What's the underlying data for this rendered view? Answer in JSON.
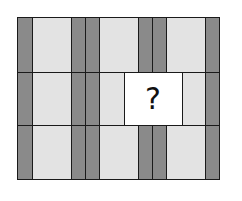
{
  "puzzle": {
    "question_mark": "?",
    "colors": {
      "dark": "#8a8a8a",
      "light": "#e3e3e3",
      "blank": "#ffffff",
      "border": "#1a1a1a"
    },
    "columns": [
      {
        "type": "dark",
        "x": 0,
        "w": 15
      },
      {
        "type": "light",
        "x": 15,
        "w": 39
      },
      {
        "type": "dark",
        "x": 54,
        "w": 14
      },
      {
        "type": "dark",
        "x": 68,
        "w": 14
      },
      {
        "type": "light",
        "x": 82,
        "w": 39
      },
      {
        "type": "dark",
        "x": 121,
        "w": 14
      },
      {
        "type": "dark",
        "x": 135,
        "w": 14
      },
      {
        "type": "light",
        "x": 149,
        "w": 39
      },
      {
        "type": "dark",
        "x": 188,
        "w": 14
      }
    ],
    "rows": [
      {
        "y": 0,
        "h": 55
      },
      {
        "y": 55,
        "h": 53
      },
      {
        "y": 108,
        "h": 54
      }
    ],
    "missing": {
      "x": 107,
      "y": 55,
      "w": 58,
      "h": 53
    }
  }
}
